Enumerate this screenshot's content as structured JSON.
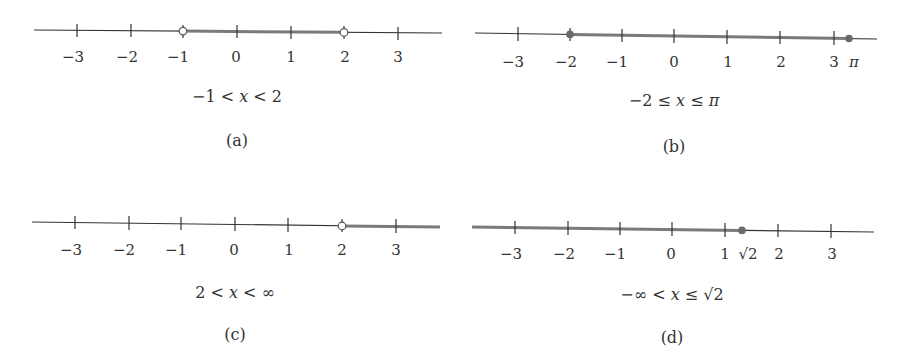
{
  "panels": [
    {
      "id": "a",
      "caption": "(a)",
      "expression": "−1 < x < 2",
      "expr_parts": [
        "−1 < ",
        "x",
        " < 2"
      ],
      "ticks": [
        {
          "value": -3,
          "label": "−3"
        },
        {
          "value": -2,
          "label": "−2"
        },
        {
          "value": -1,
          "label": "−1"
        },
        {
          "value": 0,
          "label": "0"
        },
        {
          "value": 1,
          "label": "1"
        },
        {
          "value": 2,
          "label": "2"
        },
        {
          "value": 3,
          "label": "3"
        }
      ],
      "interval": {
        "from": -1,
        "to": 2,
        "left_closed": false,
        "right_closed": false
      }
    },
    {
      "id": "b",
      "caption": "(b)",
      "expression": "−2 ≤ x ≤ π",
      "expr_parts": [
        "−2 ≤ ",
        "x",
        " ≤ ",
        "π"
      ],
      "ticks": [
        {
          "value": -3,
          "label": "−3"
        },
        {
          "value": -2,
          "label": "−2"
        },
        {
          "value": -1,
          "label": "−1"
        },
        {
          "value": 0,
          "label": "0"
        },
        {
          "value": 1,
          "label": "1"
        },
        {
          "value": 2,
          "label": "2"
        },
        {
          "value": 3,
          "label": "3"
        }
      ],
      "extra_label": "π",
      "interval": {
        "from": -2,
        "to": 3.14159,
        "left_closed": true,
        "right_closed": true
      }
    },
    {
      "id": "c",
      "caption": "(c)",
      "expression": "2 < x < ∞",
      "expr_parts": [
        "2 < ",
        "x",
        " < ∞"
      ],
      "ticks": [
        {
          "value": -3,
          "label": "−3"
        },
        {
          "value": -2,
          "label": "−2"
        },
        {
          "value": -1,
          "label": "−1"
        },
        {
          "value": 0,
          "label": "0"
        },
        {
          "value": 1,
          "label": "1"
        },
        {
          "value": 2,
          "label": "2"
        },
        {
          "value": 3,
          "label": "3"
        }
      ],
      "interval": {
        "from": 2,
        "to": "inf",
        "left_closed": false,
        "right_closed": false
      }
    },
    {
      "id": "d",
      "caption": "(d)",
      "expression": "−∞ < x ≤ √2",
      "expr_parts": [
        "−∞ < ",
        "x",
        " ≤ √2"
      ],
      "ticks": [
        {
          "value": -3,
          "label": "−3"
        },
        {
          "value": -2,
          "label": "−2"
        },
        {
          "value": -1,
          "label": "−1"
        },
        {
          "value": 0,
          "label": "0"
        },
        {
          "value": 1,
          "label": "1"
        },
        {
          "value": 2,
          "label": "2"
        },
        {
          "value": 3,
          "label": "3"
        }
      ],
      "extra_label": "√2",
      "interval": {
        "from": "-inf",
        "to": 1.41421,
        "left_closed": false,
        "right_closed": true
      }
    }
  ],
  "colors": {
    "axis": "#333333",
    "interval": "#7a7a7a",
    "point_fill": "#6a6a6a",
    "open_point_fill": "#ffffff"
  }
}
